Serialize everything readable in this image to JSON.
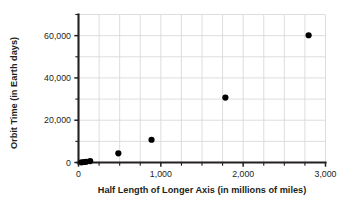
{
  "chart_data": {
    "type": "scatter",
    "title": "",
    "xlabel": "Half Length of Longer Axis (in millions of miles)",
    "ylabel": "Orbit Time (in Earth days)",
    "xlim": [
      0,
      3000
    ],
    "ylim": [
      0,
      70000
    ],
    "grid": true,
    "legend": false,
    "x_ticks": [
      0,
      1000,
      2000,
      3000
    ],
    "x_tick_labels": [
      "0",
      "1,000",
      "2,000",
      "3,000"
    ],
    "x_minor_step": 250,
    "y_ticks": [
      0,
      20000,
      40000,
      60000
    ],
    "y_tick_labels": [
      "0",
      "20,000",
      "40,000",
      "60,000"
    ],
    "y_minor_step": 10000,
    "marker": "filled-circle",
    "marker_color": "#000000",
    "marker_size": 4,
    "points": [
      {
        "x": 36,
        "y": 88
      },
      {
        "x": 67,
        "y": 225
      },
      {
        "x": 93,
        "y": 365
      },
      {
        "x": 142,
        "y": 687
      },
      {
        "x": 484,
        "y": 4333
      },
      {
        "x": 887,
        "y": 10759
      },
      {
        "x": 1784,
        "y": 30687
      },
      {
        "x": 2795,
        "y": 60190
      }
    ]
  },
  "axes": {
    "x_title": "Half Length of Longer Axis (in millions of miles)",
    "y_title": "Orbit Time (in Earth days)",
    "x_tick_labels": [
      "0",
      "1,000",
      "2,000",
      "3,000"
    ],
    "y_tick_labels": [
      "0",
      "20,000",
      "40,000",
      "60,000"
    ]
  },
  "colors": {
    "grid": "#d9d9d9",
    "axis": "#231f20",
    "marker": "#000000",
    "text": "#231f20",
    "background": "#ffffff"
  }
}
